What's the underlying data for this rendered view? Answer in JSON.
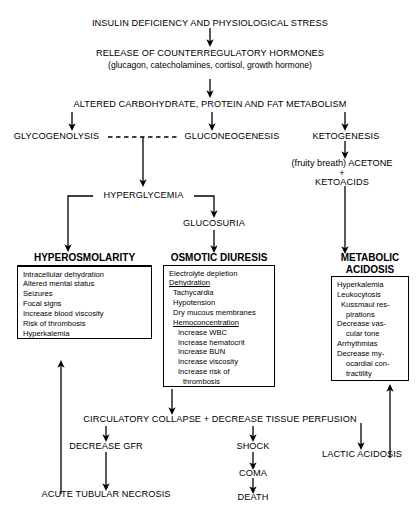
{
  "diagram": {
    "nodes": {
      "insulin_deficiency": "INSULIN DEFICIENCY AND PHYSIOLOGICAL STRESS",
      "release_hormones_line1": "RELEASE OF COUNTERREGULATORY HORMONES",
      "release_hormones_line2": "(glucagon, catecholamines, cortisol, growth hormone)",
      "altered_metabolism": "ALTERED CARBOHYDRATE, PROTEIN AND FAT METABOLISM",
      "glycogenolysis": "GLYCOGENOLYSIS",
      "gluconeogenesis": "GLUCONEOGENESIS",
      "ketogenesis": "KETOGENESIS",
      "acetone": "(fruity breath) ACETONE",
      "plus": "+",
      "ketoacids": "KETOACIDS",
      "hyperglycemia": "HYPERGLYCEMIA",
      "glucosuria": "GLUCOSURIA",
      "circulatory_collapse": "CIRCULATORY COLLAPSE + DECREASE TISSUE PERFUSION",
      "decrease_gfr": "DECREASE GFR",
      "shock": "SHOCK",
      "coma": "COMA",
      "death": "DEATH",
      "lactic_acidosis": "LACTIC ACIDOSIS",
      "acute_tubular_necrosis": "ACUTE TUBULAR NECROSIS"
    },
    "boxes": {
      "hyperosmolarity": {
        "title": "HYPEROSMOLARITY",
        "items": [
          "Intracellular dehydration",
          "Altered mental status",
          "Seizures",
          "Focal signs",
          "Increase blood viscosity",
          "Risk of thrombosis",
          "Hyperkalemia"
        ]
      },
      "osmotic_diuresis": {
        "title": "OSMOTIC DIURESIS",
        "items": [
          "Electrolyte depletion",
          "Dehydration",
          "Tachycardia",
          "Hypotension",
          "Dry mucous membranes",
          "Hemoconcentration",
          "Increase WBC",
          "Increase hematocrit",
          "Increase BUN",
          "Increase viscosity",
          "Increase risk of",
          "thrombosis"
        ]
      },
      "metabolic_acidosis": {
        "title_line1": "METABOLIC",
        "title_line2": "ACIDOSIS",
        "items": [
          "Hyperkalemia",
          "Leukocytosis",
          "Kussmaul res-",
          "pirations",
          "Decrease vas-",
          "cular tone",
          "Arrhythmias",
          "Decrease my-",
          "ocardial con-",
          "tractility"
        ]
      }
    },
    "colors": {
      "stroke": "#000000",
      "background": "#ffffff"
    }
  }
}
